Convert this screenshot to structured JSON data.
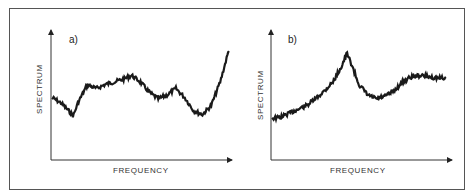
{
  "chart_data": [
    {
      "type": "line",
      "panel": "a)",
      "title": "",
      "xlabel": "FREQUENCY",
      "ylabel": "SPECTRUM",
      "grid": false,
      "axes_ticks": false,
      "note": "Noisy spectrum, normalized units (x 0-1, y 0-1); broad hump mid-range, secondary bump, sharp rise at high end",
      "x": [
        0.0,
        0.05,
        0.1,
        0.12,
        0.15,
        0.2,
        0.25,
        0.3,
        0.35,
        0.4,
        0.45,
        0.5,
        0.55,
        0.6,
        0.65,
        0.7,
        0.75,
        0.8,
        0.85,
        0.9,
        0.95,
        1.0
      ],
      "values": [
        0.48,
        0.44,
        0.37,
        0.34,
        0.45,
        0.58,
        0.55,
        0.58,
        0.6,
        0.62,
        0.65,
        0.6,
        0.52,
        0.47,
        0.5,
        0.55,
        0.48,
        0.38,
        0.35,
        0.42,
        0.6,
        0.85
      ]
    },
    {
      "type": "line",
      "panel": "b)",
      "title": "",
      "xlabel": "FREQUENCY",
      "ylabel": "SPECTRUM",
      "grid": false,
      "axes_ticks": false,
      "note": "Noisy spectrum, normalized units; rising baseline to a sharp resonance peak, dip, then plateau",
      "x": [
        0.0,
        0.05,
        0.1,
        0.15,
        0.2,
        0.25,
        0.3,
        0.35,
        0.4,
        0.43,
        0.45,
        0.5,
        0.55,
        0.6,
        0.65,
        0.7,
        0.75,
        0.8,
        0.85,
        0.9,
        0.95,
        1.0
      ],
      "values": [
        0.32,
        0.33,
        0.36,
        0.39,
        0.42,
        0.47,
        0.53,
        0.6,
        0.72,
        0.82,
        0.76,
        0.58,
        0.5,
        0.47,
        0.49,
        0.53,
        0.6,
        0.64,
        0.65,
        0.64,
        0.63,
        0.63
      ]
    }
  ],
  "panels": {
    "a": {
      "tag": "a)",
      "xlabel": "FREQUENCY",
      "ylabel": "SPECTRUM"
    },
    "b": {
      "tag": "b)",
      "xlabel": "FREQUENCY",
      "ylabel": "SPECTRUM"
    }
  },
  "colors": {
    "ink": "#1a1a1a",
    "frame": "#555555",
    "background": "#ffffff"
  }
}
